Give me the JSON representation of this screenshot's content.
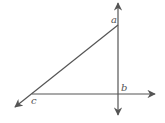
{
  "diagram": {
    "type": "geometry",
    "points": {
      "a": {
        "label": "a",
        "x": 118,
        "y": 25
      },
      "b": {
        "label": "b",
        "x": 118,
        "y": 94
      },
      "c": {
        "label": "c",
        "x": 30,
        "y": 94
      }
    },
    "lines": [
      {
        "name": "vertical-line",
        "through": [
          "a",
          "b"
        ],
        "arrows": "both"
      },
      {
        "name": "horizontal-line",
        "through": [
          "c",
          "b"
        ],
        "arrows": "right"
      },
      {
        "name": "diagonal-line",
        "through": [
          "a",
          "c"
        ],
        "arrows": "lower-left"
      }
    ],
    "colors": {
      "stroke": "#555555",
      "label": "#555555",
      "background": "#ffffff"
    }
  }
}
